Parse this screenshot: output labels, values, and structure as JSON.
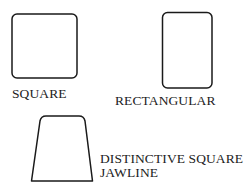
{
  "diagram": {
    "type": "face-shape-outlines",
    "shapes": [
      {
        "id": "square",
        "label": "SQUARE"
      },
      {
        "id": "rectangular",
        "label": "RECTANGULAR"
      },
      {
        "id": "square-jawline",
        "label_line1": "DISTINCTIVE SQUARE",
        "label_line2": "JAWLINE"
      }
    ],
    "colors": {
      "stroke": "#1a1a1a",
      "background": "#ffffff",
      "text": "#222222"
    }
  }
}
